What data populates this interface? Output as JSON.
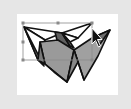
{
  "window": {
    "type": "vector-graphics-canvas"
  },
  "canvas": {
    "background": "#ffffff",
    "frame_color": "#e6e6e6"
  },
  "artwork": {
    "name": "faceted-origami-shape",
    "stroke_color": "#111111",
    "fill_light": "#ffffff",
    "fill_mid": "#9a9a9a",
    "fill_dark": "#6e6e6e"
  },
  "selection": {
    "box_color": "#8a8a8a",
    "handles": [
      "top-left",
      "top-middle",
      "top-right",
      "middle-left",
      "bottom-left",
      "bottom-right"
    ]
  },
  "cursor": {
    "type": "arrow-pointer"
  }
}
